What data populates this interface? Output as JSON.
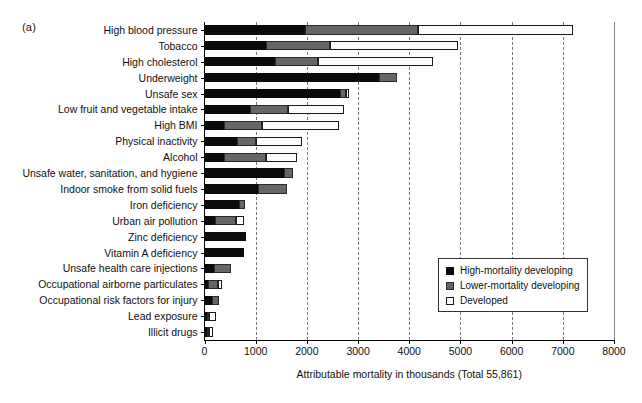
{
  "figure": {
    "panel_label": "(a)"
  },
  "legend": {
    "position": "inside-right",
    "items": [
      {
        "label": "High-mortality developing",
        "key": "high",
        "color": "#0b0b0b"
      },
      {
        "label": "Lower-mortality developing",
        "key": "lower",
        "color": "#666666"
      },
      {
        "label": "Developed",
        "key": "developed",
        "color": "#ffffff"
      }
    ]
  },
  "chart_data": {
    "type": "bar",
    "orientation": "horizontal",
    "stacked": true,
    "title": "",
    "xlabel": "Attributable mortality in thousands (Total 55,861)",
    "ylabel": "",
    "xlim": [
      0,
      8000
    ],
    "xticks": [
      0,
      1000,
      2000,
      3000,
      4000,
      5000,
      6000,
      7000,
      8000
    ],
    "xticklabels": [
      "0",
      "1000",
      "2000",
      "3000",
      "4000",
      "5000",
      "6000",
      "7000",
      "8000"
    ],
    "grid": "vertical-dashed",
    "categories": [
      "High blood pressure",
      "Tobacco",
      "High cholesterol",
      "Underweight",
      "Unsafe sex",
      "Low fruit and vegetable intake",
      "High BMI",
      "Physical inactivity",
      "Alcohol",
      "Unsafe water, sanitation, and hygiene",
      "Indoor smoke from solid fuels",
      "Iron deficiency",
      "Urban air pollution",
      "Zinc deficiency",
      "Vitamin A deficiency",
      "Unsafe health care injections",
      "Occupational airborne particulates",
      "Occupational risk factors for injury",
      "Lead exposure",
      "Illicit drugs"
    ],
    "series": [
      {
        "name": "High-mortality developing",
        "key": "high",
        "color": "#0b0b0b",
        "values": [
          1960,
          1200,
          1380,
          3410,
          2650,
          890,
          380,
          635,
          380,
          1560,
          1040,
          670,
          210,
          810,
          770,
          190,
          75,
          145,
          50,
          40
        ]
      },
      {
        "name": "Lower-mortality developing",
        "key": "lower",
        "color": "#666666",
        "values": [
          2210,
          1250,
          840,
          350,
          115,
          745,
          740,
          370,
          820,
          170,
          570,
          125,
          405,
          0,
          0,
          325,
          185,
          145,
          45,
          45
        ]
      },
      {
        "name": "Developed",
        "key": "developed",
        "color": "#ffffff",
        "values": [
          3030,
          2500,
          2250,
          0,
          55,
          1090,
          1510,
          895,
          600,
          0,
          0,
          0,
          155,
          0,
          0,
          0,
          80,
          0,
          120,
          80
        ]
      }
    ],
    "totals": [
      7200,
      4950,
      4470,
      3760,
      2820,
      2725,
      2630,
      1900,
      1800,
      1730,
      1610,
      795,
      770,
      810,
      770,
      515,
      340,
      290,
      215,
      165
    ]
  }
}
